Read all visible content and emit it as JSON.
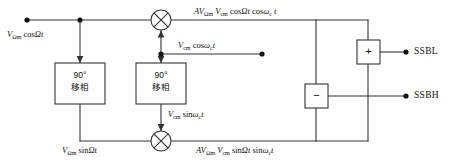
{
  "diagram": {
    "line_color": "#333333",
    "text_color": "#111111",
    "background": "#ffffff"
  },
  "signals": {
    "input_top": "VΩm cosΩt",
    "input_bottom": "VΩm sinΩt",
    "carrier_in": "Vcm cosωct",
    "carrier_shifted": "Vcm sinωct",
    "product_top": "AVΩm Vcm cosΩt cosωct",
    "product_bottom": "AVΩm Vcm sinΩt sinωct"
  },
  "labels": {
    "input_top": {
      "v": "V",
      "v_sub": "Ωm",
      "rest": " cos",
      "arg": "Ωt"
    },
    "input_bottom": {
      "v": "V",
      "v_sub": "Ωm",
      "rest": " sin",
      "arg": "Ωt"
    },
    "carrier_in": {
      "v": "V",
      "v_sub": "cm",
      "rest": " cos",
      "omega": "ω",
      "omega_sub": "c",
      "t": "t"
    },
    "carrier_shifted": {
      "v": "V",
      "v_sub": "cm",
      "rest": " sin",
      "omega": "ω",
      "omega_sub": "c",
      "t": "t"
    },
    "product_top": {
      "a": "A",
      "v1": "V",
      "v1_sub": "Ωm",
      "v2": "V",
      "v2_sub": "cm",
      "trig1": " cos",
      "arg1": "Ωt",
      "trig2": " cos",
      "omega": "ω",
      "omega_sub": "c",
      "t": "t"
    },
    "product_bottom": {
      "a": "A",
      "v1": "V",
      "v1_sub": "Ωm",
      "v2": "V",
      "v2_sub": "cm",
      "trig1": " sin",
      "arg1": "Ωt",
      "trig2": " sin",
      "omega": "ω",
      "omega_sub": "c",
      "t": "t"
    }
  },
  "blocks": {
    "phase_shifter_baseband": {
      "line1": "90°",
      "line2": "移相"
    },
    "phase_shifter_carrier": {
      "line1": "90°",
      "line2": "移相"
    },
    "adder": {
      "symbol": "+"
    },
    "subtractor": {
      "symbol": "−"
    },
    "mixer_top": {
      "symbol": "⊗"
    },
    "mixer_bottom": {
      "symbol": "⊗"
    }
  },
  "outputs": [
    {
      "label": "SSBL",
      "source": "adder"
    },
    {
      "label": "SSBH",
      "source": "subtractor"
    }
  ]
}
